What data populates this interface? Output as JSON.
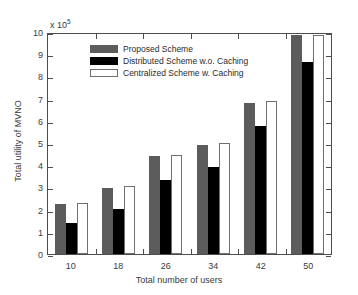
{
  "chart_data": {
    "type": "bar",
    "title": "",
    "subtitle": "",
    "xlabel": "Total number of users",
    "ylabel": "Total utility of MVNO",
    "exponent_label": "x 10",
    "exponent_power": "5",
    "y_unit_multiplier": 100000,
    "categories": [
      "10",
      "18",
      "26",
      "34",
      "42",
      "50"
    ],
    "series": [
      {
        "name": "Proposed Scheme",
        "color": "#5c5c5c",
        "values": [
          2.25,
          2.98,
          4.4,
          4.93,
          6.8,
          9.85
        ]
      },
      {
        "name": "Distributed Scheme w.o. Caching",
        "color": "#000000",
        "values": [
          1.4,
          2.05,
          3.35,
          3.9,
          5.75,
          8.65
        ]
      },
      {
        "name": "Centralized Scheme w. Caching",
        "color": "#ffffff",
        "values": [
          2.28,
          3.05,
          4.45,
          5.0,
          6.9,
          9.88
        ]
      }
    ],
    "ylim": [
      0,
      10
    ],
    "y_ticks": [
      "0",
      "1",
      "2",
      "3",
      "4",
      "5",
      "6",
      "7",
      "8",
      "9",
      "10"
    ],
    "grid": false,
    "legend_position": "top-center",
    "axis_color": "#4d4d4d"
  }
}
